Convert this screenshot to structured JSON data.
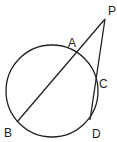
{
  "diagram": {
    "type": "geometry",
    "circle": {
      "cx": 52,
      "cy": 91,
      "r": 46
    },
    "points": {
      "P": {
        "label": "P",
        "x": 105,
        "y": 19
      },
      "A": {
        "label": "A",
        "x": 76,
        "y": 53
      },
      "B": {
        "label": "B",
        "x": 17,
        "y": 122
      },
      "C": {
        "label": "C",
        "x": 96,
        "y": 80
      },
      "D": {
        "label": "D",
        "x": 90,
        "y": 120
      }
    },
    "segments": [
      [
        "P",
        "B"
      ],
      [
        "P",
        "D"
      ]
    ],
    "stroke_color": "#222222"
  }
}
